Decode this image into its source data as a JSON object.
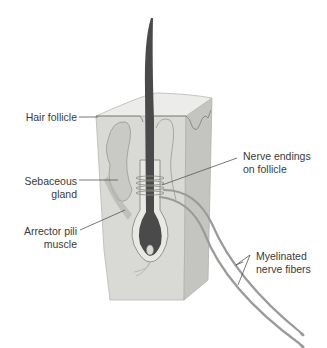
{
  "diagram": {
    "colors": {
      "skin_block": "#d9d9d6",
      "skin_side": "#c4c4c0",
      "skin_top": "#ececea",
      "hair_shaft": "#4a4a4a",
      "nerve_fiber": "#9a9a98",
      "leader_line": "#555555",
      "label_text": "#3a3a3a"
    },
    "labels": {
      "hair_follicle": "Hair follicle",
      "sebaceous_gland_1": "Sebaceous",
      "sebaceous_gland_2": "gland",
      "arrector_pili_1": "Arrector pili",
      "arrector_pili_2": "muscle",
      "nerve_endings_1": "Nerve endings",
      "nerve_endings_2": "on follicle",
      "myelinated_1": "Myelinated",
      "myelinated_2": "nerve fibers"
    }
  }
}
